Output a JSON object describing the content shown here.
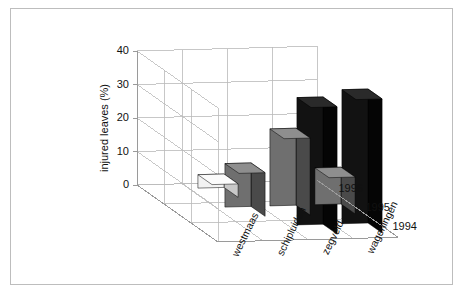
{
  "figure": {
    "background": "#ffffff",
    "frame_color": "#bdbdbd",
    "axis_color": "#9a9a9a",
    "grid_color": "#b9b9b9"
  },
  "axes": {
    "ylabel": "injured leaves (%)",
    "yticks": [
      "0",
      "10",
      "20",
      "30",
      "40"
    ],
    "ylim": [
      0,
      40
    ],
    "categories": [
      "westmaas",
      "schipluiden",
      "zegveld",
      "wageningen"
    ],
    "series_labels": [
      "1994",
      "1995",
      "1996"
    ]
  },
  "colors": {
    "1994_front": "#121212",
    "1994_side": "#050505",
    "1994_top": "#2a2a2a",
    "1995_front": "#6f6f6f",
    "1995_side": "#4a4a4a",
    "1995_top": "#8e8e8e",
    "1996_front": "#f2f2f2",
    "1996_side": "#c9c9c9",
    "1996_top": "#fbfbfb"
  },
  "chart_data": {
    "type": "bar",
    "title": "",
    "xlabel": "",
    "ylabel": "injured leaves (%)",
    "ylim": [
      0,
      40
    ],
    "yticks": [
      0,
      10,
      20,
      30,
      40
    ],
    "grid": true,
    "legend": "depth-axis",
    "projection": "3d",
    "categories": [
      "westmaas",
      "schipluiden",
      "zegveld",
      "wageningen"
    ],
    "series": [
      {
        "name": "1994",
        "values": [
          0,
          0,
          38,
          40
        ]
      },
      {
        "name": "1995",
        "values": [
          0,
          13,
          23,
          11
        ]
      },
      {
        "name": "1996",
        "values": [
          0,
          4,
          0,
          0
        ]
      }
    ]
  }
}
